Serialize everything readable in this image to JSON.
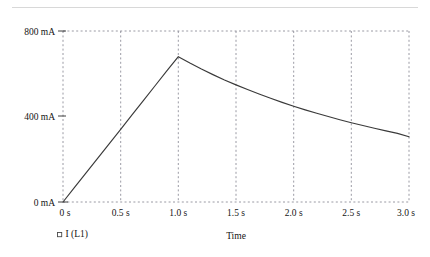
{
  "chart_data": {
    "type": "line",
    "title": "",
    "xlabel": "Time",
    "ylabel": "",
    "xlim": [
      0,
      3.0
    ],
    "ylim": [
      0,
      800
    ],
    "grid": true,
    "grid_style": "dashed",
    "legend_position": "bottom-left",
    "x_unit": "s",
    "y_unit": "mA",
    "x_tick_labels": [
      "0 s",
      "0.5 s",
      "1.0 s",
      "1.5 s",
      "2.0 s",
      "2.5 s",
      "3.0 s"
    ],
    "x_tick_values": [
      0,
      0.5,
      1.0,
      1.5,
      2.0,
      2.5,
      3.0
    ],
    "y_tick_labels": [
      "0 mA",
      "400 mA",
      "800 mA"
    ],
    "y_tick_values": [
      0,
      400,
      800
    ],
    "series": [
      {
        "name": "I (L1)",
        "marker": "open-square",
        "color": "#3a3a3a",
        "x": [
          0,
          0.1,
          0.2,
          0.3,
          0.4,
          0.5,
          0.6,
          0.7,
          0.8,
          0.9,
          1.0,
          1.1,
          1.2,
          1.3,
          1.4,
          1.5,
          1.6,
          1.7,
          1.8,
          1.9,
          2.0,
          2.1,
          2.2,
          2.3,
          2.4,
          2.5,
          2.6,
          2.7,
          2.8,
          2.9,
          3.0
        ],
        "values": [
          0,
          68,
          136,
          204,
          272,
          340,
          409,
          477,
          545,
          613,
          680,
          650,
          622,
          596,
          571,
          548,
          526,
          505,
          485,
          466,
          448,
          431,
          415,
          400,
          385,
          371,
          358,
          345,
          333,
          321,
          305
        ]
      }
    ],
    "annotations": {
      "peak_time": "1.0 s",
      "peak_value_ma": 680,
      "end_value_ma": 305,
      "start_value_ma": 0
    }
  },
  "legend": {
    "items": [
      {
        "label": "I (L1)"
      }
    ]
  },
  "axes": {
    "x_title": "Time"
  }
}
